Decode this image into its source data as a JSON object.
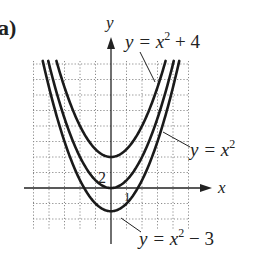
{
  "panel_label": "a)",
  "axes": {
    "x_label": "x",
    "y_label": "y",
    "x_tick_label": "1",
    "y_tick_label": "2"
  },
  "annotations": {
    "curve_top": {
      "lhs": "y = x",
      "exp": "2",
      "rhs": " + 4"
    },
    "curve_mid": {
      "lhs": "y = x",
      "exp": "2",
      "rhs": ""
    },
    "curve_bottom": {
      "lhs": "y = x",
      "exp": "2",
      "rhs": " − 3"
    }
  },
  "colors": {
    "curve": "#1a1a1a",
    "grid": "#8a8a8a",
    "axis": "#222222",
    "text": "#222222"
  },
  "chart_data": {
    "type": "line",
    "title": "",
    "xlabel": "x",
    "ylabel": "y",
    "xlim": [
      -5,
      5
    ],
    "ylim": [
      -5.4,
      16.4
    ],
    "grid": true,
    "grid_spacing": {
      "x": 1,
      "y": 2
    },
    "series": [
      {
        "name": "y = x^2 + 4",
        "formula": "x^2 + 4",
        "vertex": [
          0,
          4
        ],
        "x": [
          -3.46,
          -3,
          -2,
          -1,
          0,
          1,
          2,
          3,
          3.46
        ],
        "y": [
          16,
          13,
          8,
          5,
          4,
          5,
          8,
          13,
          16
        ]
      },
      {
        "name": "y = x^2",
        "formula": "x^2",
        "vertex": [
          0,
          0
        ],
        "x": [
          -4,
          -3,
          -2,
          -1,
          0,
          1,
          2,
          3,
          4
        ],
        "y": [
          16,
          9,
          4,
          1,
          0,
          1,
          4,
          9,
          16
        ]
      },
      {
        "name": "y = x^2 - 3",
        "formula": "x^2 - 3",
        "vertex": [
          0,
          -3
        ],
        "x": [
          -4.36,
          -3,
          -2,
          -1,
          0,
          1,
          2,
          3,
          4.36
        ],
        "y": [
          16,
          6,
          1,
          -2,
          -3,
          -2,
          1,
          6,
          16
        ]
      }
    ],
    "tick_labels": {
      "x": [
        "1"
      ],
      "y": [
        "2"
      ]
    },
    "legend": "none (curves labeled directly with leader lines)"
  }
}
